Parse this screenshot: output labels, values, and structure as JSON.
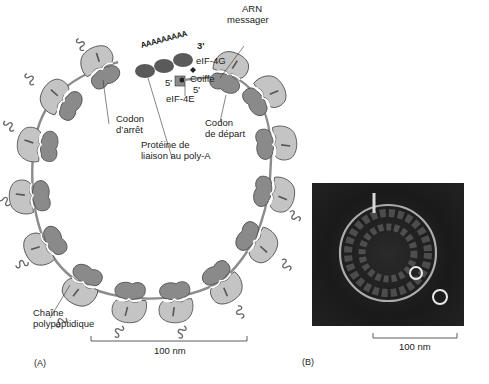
{
  "panel_a": {
    "label": "(A)",
    "labels": {
      "arn_messager_1": "ARN",
      "arn_messager_2": "messager",
      "three_prime": "3'",
      "eif4g": "eIF-4G",
      "five_prime_left": "5'",
      "coiffe": "Coiffe",
      "five_prime_cap": "5'",
      "eif4e": "eIF-4E",
      "codon_arret_1": "Codon",
      "codon_arret_2": "d’arrêt",
      "codon_depart_1": "Codon",
      "codon_depart_2": "de départ",
      "proteine_1": "Protéine de",
      "proteine_2": "liaison au poly-A",
      "chaine_1": "Chaîne",
      "chaine_2": "polypeptidique",
      "polyA_seq": "AAAAAAAAA",
      "stop_codon": "UAG",
      "start_codon": "AUG"
    },
    "scale_bar": "100 nm"
  },
  "panel_b": {
    "label": "(B)",
    "scale_bar": "100 nm"
  },
  "colors": {
    "large_subunit": "#c4c4c4",
    "small_subunit": "#8a8a8a",
    "mrna": "#8c8c8c",
    "polyA_protein": "#5a5a5a",
    "outline": "#4a4a4a",
    "micrograph_bg": "#1e1e1e",
    "micrograph_ring": "#d8d8d8"
  }
}
